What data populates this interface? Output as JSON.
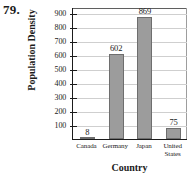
{
  "problem": {
    "number": "79."
  },
  "chart_data": {
    "type": "bar",
    "title": "",
    "xlabel": "Country",
    "ylabel": "Population Density",
    "categories": [
      "Canada",
      "Germany",
      "Japan",
      "United\nStates"
    ],
    "values": [
      8,
      602,
      869,
      75
    ],
    "value_labels": [
      "8",
      "602",
      "869",
      "75"
    ],
    "ylim": [
      0,
      940
    ],
    "yticks": [
      100,
      200,
      300,
      400,
      500,
      600,
      700,
      800,
      900
    ],
    "ytick_labels": [
      "100",
      "200",
      "300",
      "400",
      "500",
      "600",
      "700",
      "800",
      "900"
    ],
    "grid": true,
    "legend": null,
    "bar_color": "#9c9c9c",
    "bar_edge_color": "#6e6e6e",
    "grid_color": "#cfcfcf",
    "axis_color": "#1b1b1b"
  }
}
